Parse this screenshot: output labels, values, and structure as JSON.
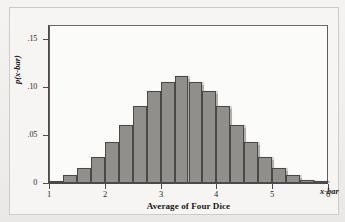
{
  "figure": {
    "background_color": "#f2f1ef",
    "plot_background_color": "#fbfbfa",
    "frame_color": "#5d5d5d",
    "bar_fill_color": "#918f8c",
    "bar_edge_color": "#4a4947"
  },
  "axes": {
    "x_var_label": "x-bar",
    "y_title": "p(x-bar)",
    "x_title": "Average of Four Dice"
  },
  "chart_data": {
    "type": "bar",
    "title": "",
    "subtitle": "",
    "xlabel": "Average of Four Dice",
    "ylabel": "p(x-bar)",
    "xlim": [
      1,
      6
    ],
    "ylim": [
      0,
      0.165
    ],
    "grid": false,
    "legend": false,
    "bar_width": 0.25,
    "x_ticks": [
      1,
      2,
      3,
      4,
      5,
      6
    ],
    "x_tick_labels": [
      "1",
      "2",
      "3",
      "4",
      "5",
      "6"
    ],
    "y_ticks": [
      0,
      0.05,
      0.1,
      0.15
    ],
    "y_tick_labels": [
      "0",
      ".05",
      ".10",
      ".15"
    ],
    "annotations": [
      "x-bar"
    ],
    "categories": [
      "1.00-1.25",
      "1.25-1.50",
      "1.50-1.75",
      "1.75-2.00",
      "2.00-2.25",
      "2.25-2.50",
      "2.50-2.75",
      "2.75-3.00",
      "3.00-3.25",
      "3.25-3.50",
      "3.50-3.75",
      "3.75-4.00",
      "4.00-4.25",
      "4.25-4.50",
      "4.50-4.75",
      "4.75-5.00",
      "5.00-5.25",
      "5.25-5.50",
      "5.50-5.75",
      "5.75-6.00"
    ],
    "bin_centers": [
      1.125,
      1.375,
      1.625,
      1.875,
      2.125,
      2.375,
      2.625,
      2.875,
      3.125,
      3.375,
      3.625,
      3.875,
      4.125,
      4.375,
      4.625,
      4.875,
      5.125,
      5.375,
      5.625,
      5.875
    ],
    "bin_left_edges": [
      1.0,
      1.25,
      1.5,
      1.75,
      2.0,
      2.25,
      2.5,
      2.75,
      3.0,
      3.25,
      3.5,
      3.75,
      4.0,
      4.25,
      4.5,
      4.75,
      5.0,
      5.25,
      5.5,
      5.75
    ],
    "values": [
      0.002,
      0.008,
      0.016,
      0.027,
      0.043,
      0.061,
      0.08,
      0.096,
      0.106,
      0.112,
      0.106,
      0.096,
      0.08,
      0.061,
      0.043,
      0.027,
      0.016,
      0.008,
      0.003,
      0.001
    ]
  }
}
